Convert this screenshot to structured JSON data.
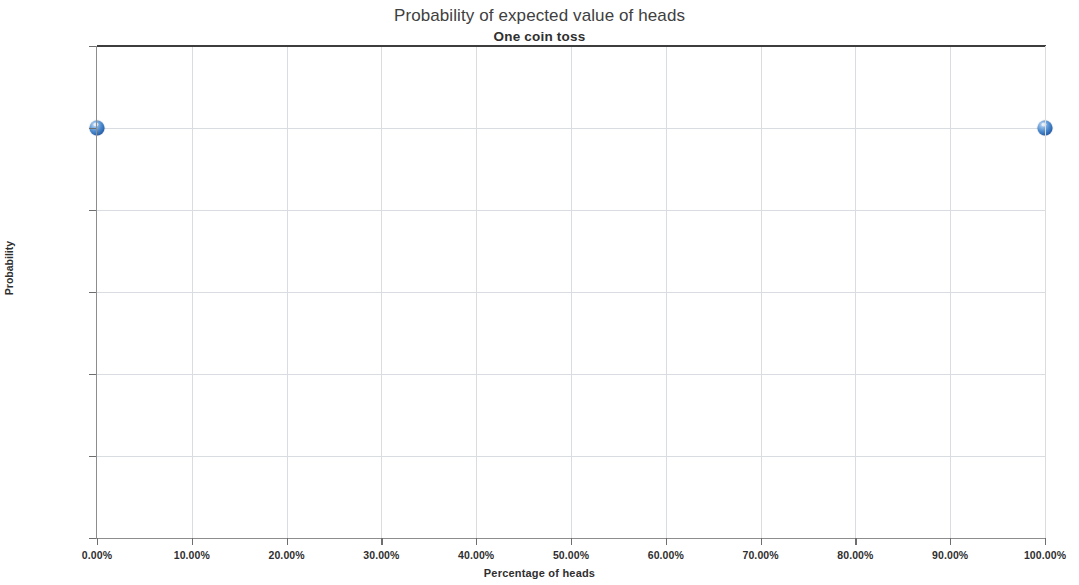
{
  "chart_data": {
    "type": "scatter",
    "title": "Probability of expected value of heads",
    "subtitle": "One coin toss",
    "xlabel": "Percentage of heads",
    "ylabel": "Probability",
    "grid": true,
    "legend": "none",
    "series_color": "#2E6DB4",
    "xlim": [
      0,
      100
    ],
    "ylim": [
      0,
      60
    ],
    "x_tick_labels": [
      "0.00%",
      "10.00%",
      "20.00%",
      "30.00%",
      "40.00%",
      "50.00%",
      "60.00%",
      "70.00%",
      "80.00%",
      "90.00%",
      "100.00%"
    ],
    "x_tick_values": [
      0,
      10,
      20,
      30,
      40,
      50,
      60,
      70,
      80,
      90,
      100
    ],
    "y_tick_labels": [
      "0.00%",
      "10.00%",
      "20.00%",
      "30.00%",
      "40.00%",
      "50.00%",
      "60.00%"
    ],
    "y_tick_values": [
      0,
      10,
      20,
      30,
      40,
      50,
      60
    ],
    "series": [
      {
        "name": "Probability",
        "points": [
          {
            "x": 0,
            "y": 50,
            "label": "0.00%, 50.00%"
          },
          {
            "x": 100,
            "y": 50,
            "label": "100.00%, 50.00%"
          }
        ]
      }
    ]
  }
}
